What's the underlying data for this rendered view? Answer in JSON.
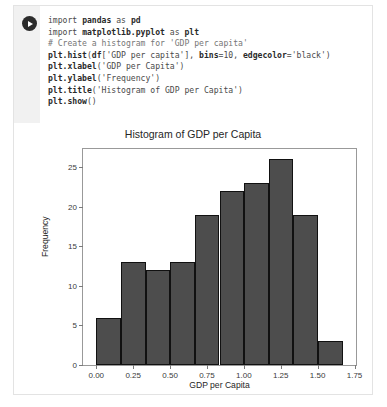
{
  "cell": {
    "run_button": {
      "icon": "play-circle-icon",
      "label": "Run"
    },
    "code_lines": [
      {
        "type": "code",
        "text": "import pandas as pd"
      },
      {
        "type": "code",
        "text": "import matplotlib.pyplot as plt"
      },
      {
        "type": "blank",
        "text": ""
      },
      {
        "type": "comment",
        "text": "# Create a histogram for 'GDP per capita'"
      },
      {
        "type": "code",
        "text": "plt.hist(df['GDP per capita'], bins=10, edgecolor='black')"
      },
      {
        "type": "code",
        "text": "plt.xlabel('GDP per Capita')"
      },
      {
        "type": "code",
        "text": "plt.ylabel('Frequency')"
      },
      {
        "type": "code",
        "text": "plt.title('Histogram of GDP per Capita')"
      },
      {
        "type": "code",
        "text": "plt.show()"
      }
    ]
  },
  "chart_data": {
    "type": "bar",
    "title": "Histogram of GDP per Capita",
    "xlabel": "GDP per Capita",
    "ylabel": "Frequency",
    "xlim": [
      -0.09,
      1.76
    ],
    "ylim": [
      0,
      27.3
    ],
    "grid": false,
    "legend": null,
    "bin_edges": [
      0.0,
      0.167,
      0.334,
      0.501,
      0.668,
      0.835,
      1.002,
      1.169,
      1.336,
      1.503,
      1.67
    ],
    "values": [
      6,
      13,
      12,
      13,
      19,
      22,
      23,
      26,
      19,
      3
    ],
    "bar_color": "#4d4d4d",
    "bar_edge_color": "#111111",
    "xticks": [
      "0.00",
      "0.25",
      "0.50",
      "0.75",
      "1.00",
      "1.25",
      "1.50",
      "1.75"
    ],
    "xtick_values": [
      0.0,
      0.25,
      0.5,
      0.75,
      1.0,
      1.25,
      1.5,
      1.75
    ],
    "yticks": [
      "0",
      "5",
      "10",
      "15",
      "20",
      "25"
    ],
    "ytick_values": [
      0,
      5,
      10,
      15,
      20,
      25
    ]
  }
}
